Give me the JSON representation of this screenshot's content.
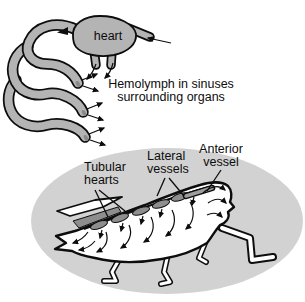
{
  "figure_type": "open-circulatory-system-diagram",
  "colors": {
    "background": "#ffffff",
    "tube_fill": "#b4b4b4",
    "sinus_ellipse": "#d2d2d2",
    "vessel_dark": "#8e8e8e",
    "body_fill": "#ffffff",
    "ink": "#0d0d0d"
  },
  "schematic": {
    "heart_label": "heart",
    "caption": "Hemolymph in sinuses\nsurrounding organs"
  },
  "grasshopper": {
    "label_tubular_hearts": "Tubular\nhearts",
    "label_lateral_vessels": "Lateral\nvessels",
    "label_anterior_vessel": "Anterior\nvessel"
  }
}
